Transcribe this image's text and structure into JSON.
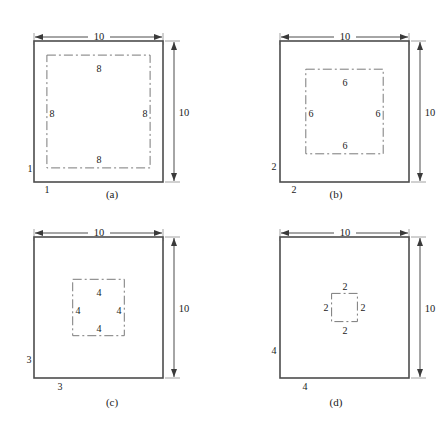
{
  "figure": {
    "colors": {
      "background": "#ffffff",
      "outline": "#4d4d4d",
      "dashed": "#7a7a7a",
      "text": "#1a1a1a"
    }
  },
  "panels": [
    {
      "id": "a",
      "caption": "(a)",
      "width_label": "10",
      "height_label": "10",
      "offset_left_label": "1",
      "offset_bottom_label": "1",
      "inner_top_label": "8",
      "inner_bottom_label": "8",
      "inner_left_label": "8",
      "inner_right_label": "8"
    },
    {
      "id": "b",
      "caption": "(b)",
      "width_label": "10",
      "height_label": "10",
      "offset_left_label": "2",
      "offset_bottom_label": "2",
      "inner_top_label": "6",
      "inner_bottom_label": "6",
      "inner_left_label": "6",
      "inner_right_label": "6"
    },
    {
      "id": "c",
      "caption": "(c)",
      "width_label": "10",
      "height_label": "10",
      "offset_left_label": "3",
      "offset_bottom_label": "3",
      "inner_top_label": "4",
      "inner_bottom_label": "4",
      "inner_left_label": "4",
      "inner_right_label": "4"
    },
    {
      "id": "d",
      "caption": "(d)",
      "width_label": "10",
      "height_label": "10",
      "offset_left_label": "4",
      "offset_bottom_label": "4",
      "inner_top_label": "2",
      "inner_bottom_label": "2",
      "inner_left_label": "2",
      "inner_right_label": "2"
    }
  ]
}
